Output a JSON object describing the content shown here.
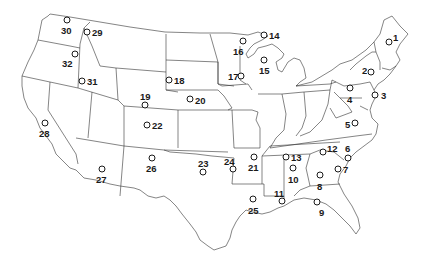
{
  "map": {
    "title": "",
    "region": "Contiguous United States",
    "style": {
      "line_color": "#333333",
      "background": "#ffffff",
      "marker_color": "#1a1a1a"
    },
    "markers": [
      {
        "id": "1",
        "x": 389,
        "y": 42,
        "lx": 393,
        "ly": 33
      },
      {
        "id": "2",
        "x": 371,
        "y": 72,
        "lx": 362,
        "ly": 66
      },
      {
        "id": "3",
        "x": 375,
        "y": 95,
        "lx": 381,
        "ly": 91
      },
      {
        "id": "4",
        "x": 350,
        "y": 88,
        "lx": 347,
        "ly": 95
      },
      {
        "id": "5",
        "x": 355,
        "y": 123,
        "lx": 345,
        "ly": 120
      },
      {
        "id": "6",
        "x": 348,
        "y": 158,
        "lx": 345,
        "ly": 144
      },
      {
        "id": "7",
        "x": 338,
        "y": 169,
        "lx": 343,
        "ly": 165
      },
      {
        "id": "8",
        "x": 320,
        "y": 175,
        "lx": 317,
        "ly": 182
      },
      {
        "id": "9",
        "x": 317,
        "y": 202,
        "lx": 319,
        "ly": 208
      },
      {
        "id": "10",
        "x": 293,
        "y": 168,
        "lx": 288,
        "ly": 175
      },
      {
        "id": "11",
        "x": 282,
        "y": 201,
        "lx": 274,
        "ly": 189
      },
      {
        "id": "12",
        "x": 323,
        "y": 152,
        "lx": 327,
        "ly": 144
      },
      {
        "id": "13",
        "x": 286,
        "y": 157,
        "lx": 291,
        "ly": 153
      },
      {
        "id": "14",
        "x": 264,
        "y": 35,
        "lx": 269,
        "ly": 31
      },
      {
        "id": "15",
        "x": 264,
        "y": 60,
        "lx": 259,
        "ly": 66
      },
      {
        "id": "16",
        "x": 243,
        "y": 41,
        "lx": 233,
        "ly": 47
      },
      {
        "id": "17",
        "x": 241,
        "y": 76,
        "lx": 228,
        "ly": 72
      },
      {
        "id": "18",
        "x": 169,
        "y": 80,
        "lx": 174,
        "ly": 76
      },
      {
        "id": "19",
        "x": 145,
        "y": 105,
        "lx": 140,
        "ly": 92
      },
      {
        "id": "20",
        "x": 190,
        "y": 99,
        "lx": 195,
        "ly": 96
      },
      {
        "id": "21",
        "x": 254,
        "y": 157,
        "lx": 248,
        "ly": 163
      },
      {
        "id": "22",
        "x": 147,
        "y": 125,
        "lx": 152,
        "ly": 121
      },
      {
        "id": "23",
        "x": 203,
        "y": 172,
        "lx": 198,
        "ly": 159
      },
      {
        "id": "24",
        "x": 233,
        "y": 169,
        "lx": 224,
        "ly": 157
      },
      {
        "id": "25",
        "x": 253,
        "y": 199,
        "lx": 248,
        "ly": 206
      },
      {
        "id": "26",
        "x": 152,
        "y": 158,
        "lx": 146,
        "ly": 164
      },
      {
        "id": "27",
        "x": 102,
        "y": 169,
        "lx": 96,
        "ly": 175
      },
      {
        "id": "28",
        "x": 45,
        "y": 123,
        "lx": 39,
        "ly": 129
      },
      {
        "id": "29",
        "x": 87,
        "y": 32,
        "lx": 92,
        "ly": 28
      },
      {
        "id": "30",
        "x": 67,
        "y": 20,
        "lx": 61,
        "ly": 26
      },
      {
        "id": "31",
        "x": 82,
        "y": 81,
        "lx": 87,
        "ly": 77
      },
      {
        "id": "32",
        "x": 75,
        "y": 54,
        "lx": 62,
        "ly": 59
      }
    ]
  }
}
